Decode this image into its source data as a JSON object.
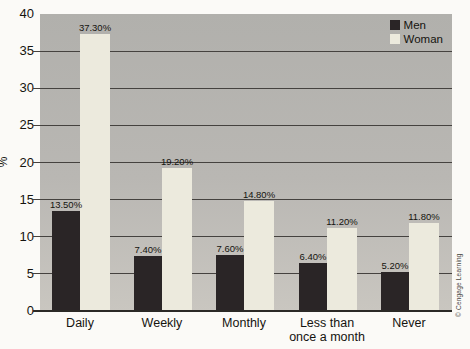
{
  "figure": {
    "credit": "© Cengage Learning"
  },
  "chart_data": {
    "type": "bar",
    "categories": [
      "Daily",
      "Weekly",
      "Monthly",
      "Less than\nonce a month",
      "Never"
    ],
    "series": [
      {
        "name": "Men",
        "color": "#2a2526",
        "values": [
          13.5,
          7.4,
          7.6,
          6.4,
          5.2
        ],
        "labels": [
          "13.50%",
          "7.40%",
          "7.60%",
          "6.40%",
          "5.20%"
        ]
      },
      {
        "name": "Woman",
        "color": "#eceadd",
        "values": [
          37.3,
          19.2,
          14.8,
          11.2,
          11.8
        ],
        "labels": [
          "37.30%",
          "19.20%",
          "14.80%",
          "11.20%",
          "11.80%"
        ]
      }
    ],
    "ylabel": "%",
    "ylim": [
      0,
      40
    ],
    "ytick_step": 5,
    "yticks": [
      "0",
      "5",
      "10",
      "15",
      "20",
      "25",
      "30",
      "35",
      "40"
    ],
    "grid": true,
    "legend_position": "top-right",
    "plot_bg": "#b9b7b3",
    "gridline_color": "#45423f"
  }
}
